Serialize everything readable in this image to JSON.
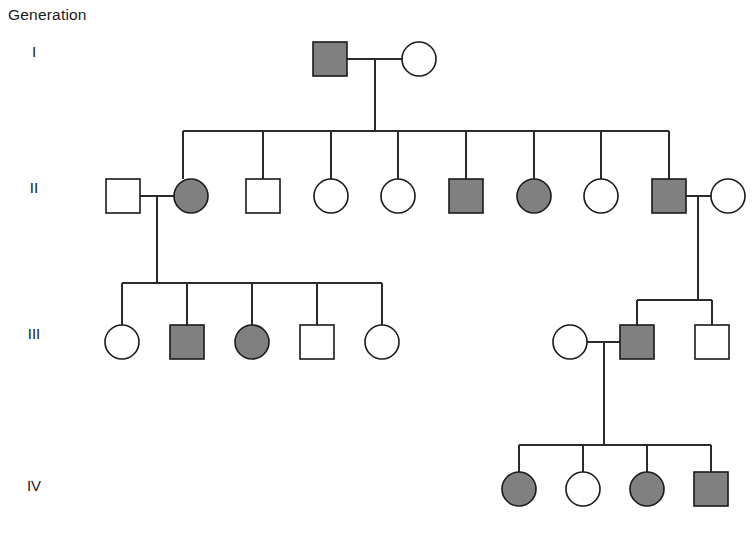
{
  "figure": {
    "type": "pedigree-chart",
    "caption": "Generation",
    "width": 756,
    "height": 539,
    "background": "#ffffff"
  },
  "style": {
    "affected_fill": "#808080",
    "unaffected_fill": "#ffffff",
    "stroke": "#1a1a1a",
    "line_color": "#2b2b2b",
    "stroke_width": 1.6,
    "line_width": 1.3,
    "square_size": 34,
    "circle_radius": 17
  },
  "legend_semantics": {
    "square": "male",
    "circle": "female",
    "filled": "affected",
    "open": "unaffected"
  },
  "generations": [
    {
      "id": "I",
      "label": "I",
      "label_x": 34,
      "label_y": 52,
      "row_y": 59,
      "individuals": [
        {
          "id": "I-1",
          "sex": "male",
          "shape": "square",
          "affected": true,
          "x": 330,
          "y": 59
        },
        {
          "id": "I-2",
          "sex": "female",
          "shape": "circle",
          "affected": false,
          "x": 419,
          "y": 59
        }
      ]
    },
    {
      "id": "II",
      "label": "II",
      "label_x": 34,
      "label_y": 188,
      "row_y": 196,
      "individuals": [
        {
          "id": "II-1",
          "sex": "male",
          "shape": "square",
          "affected": false,
          "x": 123,
          "y": 196,
          "married_in": true
        },
        {
          "id": "II-2",
          "sex": "female",
          "shape": "circle",
          "affected": true,
          "x": 191,
          "y": 196
        },
        {
          "id": "II-3",
          "sex": "male",
          "shape": "square",
          "affected": false,
          "x": 263,
          "y": 196
        },
        {
          "id": "II-4",
          "sex": "female",
          "shape": "circle",
          "affected": false,
          "x": 331,
          "y": 196
        },
        {
          "id": "II-5",
          "sex": "female",
          "shape": "circle",
          "affected": false,
          "x": 398,
          "y": 196
        },
        {
          "id": "II-6",
          "sex": "male",
          "shape": "square",
          "affected": true,
          "x": 466,
          "y": 196
        },
        {
          "id": "II-7",
          "sex": "female",
          "shape": "circle",
          "affected": true,
          "x": 534,
          "y": 196
        },
        {
          "id": "II-8",
          "sex": "female",
          "shape": "circle",
          "affected": false,
          "x": 601,
          "y": 196
        },
        {
          "id": "II-9",
          "sex": "male",
          "shape": "square",
          "affected": true,
          "x": 669,
          "y": 196
        },
        {
          "id": "II-10",
          "sex": "female",
          "shape": "circle",
          "affected": false,
          "x": 728,
          "y": 196,
          "married_in": true
        }
      ]
    },
    {
      "id": "III",
      "label": "III",
      "label_x": 34,
      "label_y": 334,
      "row_y": 342,
      "individuals": [
        {
          "id": "III-1",
          "sex": "female",
          "shape": "circle",
          "affected": false,
          "x": 122,
          "y": 342
        },
        {
          "id": "III-2",
          "sex": "male",
          "shape": "square",
          "affected": true,
          "x": 187,
          "y": 342
        },
        {
          "id": "III-3",
          "sex": "female",
          "shape": "circle",
          "affected": true,
          "x": 252,
          "y": 342
        },
        {
          "id": "III-4",
          "sex": "male",
          "shape": "square",
          "affected": false,
          "x": 317,
          "y": 342
        },
        {
          "id": "III-5",
          "sex": "female",
          "shape": "circle",
          "affected": false,
          "x": 382,
          "y": 342
        },
        {
          "id": "III-6",
          "sex": "female",
          "shape": "circle",
          "affected": false,
          "x": 570,
          "y": 342,
          "married_in": true
        },
        {
          "id": "III-7",
          "sex": "male",
          "shape": "square",
          "affected": true,
          "x": 637,
          "y": 342
        },
        {
          "id": "III-8",
          "sex": "male",
          "shape": "square",
          "affected": false,
          "x": 712,
          "y": 342
        }
      ]
    },
    {
      "id": "IV",
      "label": "IV",
      "label_x": 34,
      "label_y": 486,
      "row_y": 489,
      "individuals": [
        {
          "id": "IV-1",
          "sex": "female",
          "shape": "circle",
          "affected": true,
          "x": 519,
          "y": 489
        },
        {
          "id": "IV-2",
          "sex": "female",
          "shape": "circle",
          "affected": false,
          "x": 583,
          "y": 489
        },
        {
          "id": "IV-3",
          "sex": "female",
          "shape": "circle",
          "affected": true,
          "x": 647,
          "y": 489
        },
        {
          "id": "IV-4",
          "sex": "male",
          "shape": "square",
          "affected": true,
          "x": 711,
          "y": 489
        }
      ]
    }
  ],
  "matings": [
    {
      "id": "mating-I",
      "partner_a": "I-1",
      "partner_b": "I-2",
      "line_y": 59,
      "x_from": 347,
      "x_to": 402,
      "drop_x": 375,
      "drop_to_y": 131
    },
    {
      "id": "mating-II-left",
      "partner_a": "II-1",
      "partner_b": "II-2",
      "line_y": 196,
      "x_from": 140,
      "x_to": 174,
      "drop_x": 157,
      "drop_to_y": 283
    },
    {
      "id": "mating-II-right",
      "partner_a": "II-9",
      "partner_b": "II-10",
      "line_y": 196,
      "x_from": 686,
      "x_to": 711,
      "drop_x": 698,
      "drop_to_y": 300
    },
    {
      "id": "mating-III-right",
      "partner_a": "III-6",
      "partner_b": "III-7",
      "line_y": 342,
      "x_from": 587,
      "x_to": 620,
      "drop_x": 604,
      "drop_to_y": 445
    }
  ],
  "sibships": [
    {
      "id": "sibship-II",
      "parents": "mating-I",
      "bar_y": 131,
      "bar_x_from": 183,
      "bar_x_to": 669,
      "drop_to_y": 179,
      "child_x": [
        183,
        263,
        331,
        398,
        466,
        534,
        601,
        669
      ]
    },
    {
      "id": "sibship-III-left",
      "parents": "mating-II-left",
      "bar_y": 283,
      "bar_x_from": 122,
      "bar_x_to": 382,
      "drop_to_y": 325,
      "child_x": [
        122,
        187,
        252,
        317,
        382
      ]
    },
    {
      "id": "sibship-III-right",
      "parents": "mating-II-right",
      "bar_y": 300,
      "bar_x_from": 637,
      "bar_x_to": 712,
      "drop_to_y": 325,
      "child_x": [
        637,
        712
      ]
    },
    {
      "id": "sibship-IV",
      "parents": "mating-III-right",
      "bar_y": 445,
      "bar_x_from": 519,
      "bar_x_to": 711,
      "drop_to_y": 472,
      "child_x": [
        519,
        583,
        647,
        711
      ]
    }
  ]
}
